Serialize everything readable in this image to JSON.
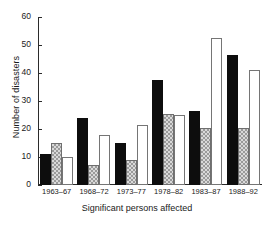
{
  "chart_data": {
    "type": "bar",
    "title": "",
    "xlabel": "Significant  persons affected",
    "ylabel": "Number of disasters",
    "ylim": [
      0,
      60
    ],
    "yticks": [
      0,
      10,
      20,
      30,
      40,
      50,
      60
    ],
    "grid": false,
    "legend": "none",
    "categories": [
      "1963–67",
      "1968–72",
      "1973–77",
      "1978–82",
      "1983–87",
      "1988–92"
    ],
    "series": [
      {
        "name": "series-black",
        "fill": "solid-black",
        "color": "#0d0d0d",
        "values": [
          11,
          24,
          15,
          37.5,
          26.5,
          46.5
        ]
      },
      {
        "name": "series-hatched",
        "fill": "checkered-grey",
        "color": "#9a9a9a",
        "values": [
          15,
          7,
          9,
          25.5,
          20.5,
          20.5
        ]
      },
      {
        "name": "series-white",
        "fill": "open-white",
        "color": "#ffffff",
        "values": [
          10,
          18,
          21.5,
          25,
          52.5,
          41
        ]
      }
    ]
  }
}
